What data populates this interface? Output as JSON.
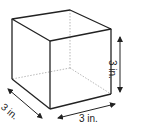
{
  "figure": {
    "shape": "cube",
    "labels": {
      "height": "3 in.",
      "width": "3 in.",
      "depth": "3 in."
    },
    "colors": {
      "stroke": "#222222",
      "hidden": "#999999"
    }
  }
}
